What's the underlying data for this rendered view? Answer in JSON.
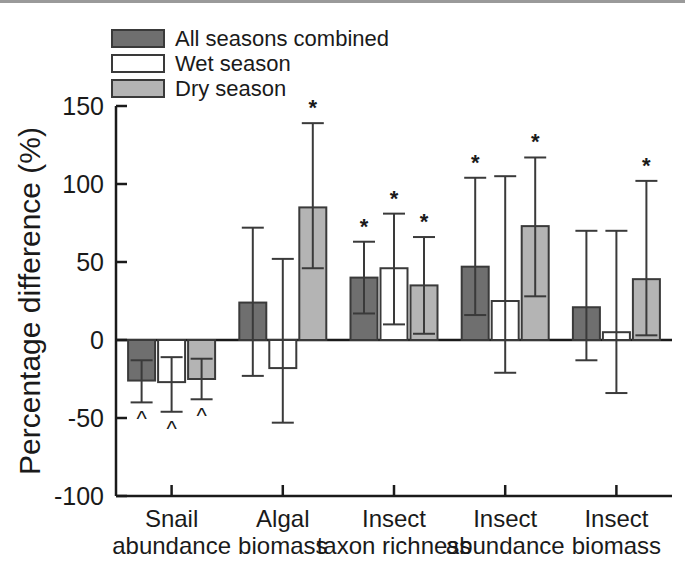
{
  "figure": {
    "title": "",
    "y_axis_label": "Percentage difference (%)"
  },
  "legend": {
    "items": [
      {
        "label": "All seasons combined",
        "color": "#6f6f6f",
        "key": "all_seasons"
      },
      {
        "label": "Wet season",
        "color": "#ffffff",
        "key": "wet_season"
      },
      {
        "label": "Dry season",
        "color": "#b4b4b4",
        "key": "dry_season"
      }
    ]
  },
  "axes": {
    "y_ticks": [
      "150",
      "100",
      "50",
      "0",
      "-50",
      "-100"
    ],
    "y_tick_values": [
      150,
      100,
      50,
      0,
      -50,
      -100
    ],
    "ylim": [
      -100,
      150
    ],
    "grid": false
  },
  "annotations": {
    "significant_marker": "*",
    "negative_marker": "^",
    "marker_note": "* and ^ denote significant differences"
  },
  "chart_data": {
    "type": "bar",
    "title": "",
    "xlabel": "",
    "ylabel": "Percentage difference (%)",
    "ylim": [
      -100,
      150
    ],
    "grid": false,
    "legend_position": "top-left",
    "error_bar_type": "confidence interval",
    "categories": [
      "Snail abundance",
      "Algal biomass",
      "Insect taxon richness",
      "Insect abundance",
      "Insect biomass"
    ],
    "category_lines": [
      [
        "Snail",
        "abundance"
      ],
      [
        "Algal",
        "biomass"
      ],
      [
        "Insect",
        "taxon richness"
      ],
      [
        "Insect",
        "abundance"
      ],
      [
        "Insect",
        "biomass"
      ]
    ],
    "series": [
      {
        "name": "All seasons combined",
        "color": "#6f6f6f",
        "values": [
          -26,
          24,
          40,
          47,
          21
        ],
        "err_low": [
          -40,
          -23,
          17,
          16,
          -13
        ],
        "err_high": [
          -13,
          72,
          63,
          104,
          70
        ],
        "markers": [
          "^",
          "",
          "*",
          "*",
          ""
        ]
      },
      {
        "name": "Wet season",
        "color": "#ffffff",
        "values": [
          -27,
          -18,
          46,
          25,
          5
        ],
        "err_low": [
          -46,
          -53,
          10,
          -21,
          -34
        ],
        "err_high": [
          -11,
          52,
          81,
          105,
          70
        ],
        "markers": [
          "^",
          "",
          "*",
          "",
          ""
        ]
      },
      {
        "name": "Dry season",
        "color": "#b4b4b4",
        "values": [
          -25,
          85,
          35,
          73,
          39
        ],
        "err_low": [
          -38,
          46,
          4,
          28,
          3
        ],
        "err_high": [
          -12,
          139,
          66,
          117,
          102
        ],
        "markers": [
          "^",
          "*",
          "*",
          "*",
          "*"
        ]
      }
    ]
  }
}
